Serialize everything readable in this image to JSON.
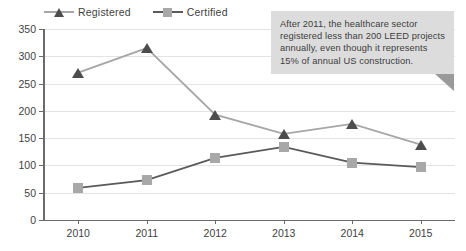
{
  "chart_data": {
    "type": "line",
    "title": "",
    "subtitle": "",
    "xlabel": "",
    "ylabel": "",
    "categories": [
      "2010",
      "2011",
      "2012",
      "2013",
      "2014",
      "2015"
    ],
    "series": [
      {
        "name": "Registered",
        "values": [
          270,
          315,
          193,
          158,
          176,
          138
        ],
        "marker": "triangle",
        "marker_color": "#4d4d4d",
        "line_color": "#a6a6a6"
      },
      {
        "name": "Certified",
        "values": [
          59,
          73,
          114,
          134,
          105,
          97
        ],
        "marker": "square",
        "marker_color": "#a8a8a8",
        "line_color": "#5a5a5a"
      }
    ],
    "ylim": [
      0,
      350
    ],
    "ytick_step": 50,
    "ytick_labels": [
      "0",
      "50",
      "100",
      "150",
      "200",
      "250",
      "300",
      "350"
    ],
    "xtick_labels": [
      "2010",
      "2011",
      "2012",
      "2013",
      "2014",
      "2015"
    ],
    "grid": "horizontal",
    "legend_position": "top-left",
    "annotations": [
      {
        "name": "callout",
        "lines": [
          "After 2011, the healthcare sector",
          "registered less than 200 LEED projects",
          "annually, even though it represents",
          "15% of annual US construction."
        ],
        "fill_color": "#dcdcdc",
        "tail_color": "#9a9a9a"
      }
    ]
  },
  "legend": {
    "items": [
      {
        "label": "Registered"
      },
      {
        "label": "Certified"
      }
    ]
  },
  "callout": {
    "line1": "After 2011, the healthcare sector",
    "line2": "registered less than 200 LEED projects",
    "line3": "annually, even though it represents",
    "line4": "15% of annual US construction."
  }
}
